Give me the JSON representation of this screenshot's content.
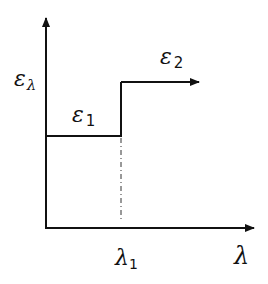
{
  "diagram": {
    "y_axis_label": "ε",
    "y_axis_label_sub": "λ",
    "x_axis_label": "λ",
    "x_tick_label": "λ",
    "x_tick_label_sub": "1",
    "segment1_label": "ε",
    "segment1_label_sub": "1",
    "segment2_label": "ε",
    "segment2_label_sub": "2"
  },
  "colors": {
    "stroke": "#111111",
    "background": "#ffffff"
  }
}
